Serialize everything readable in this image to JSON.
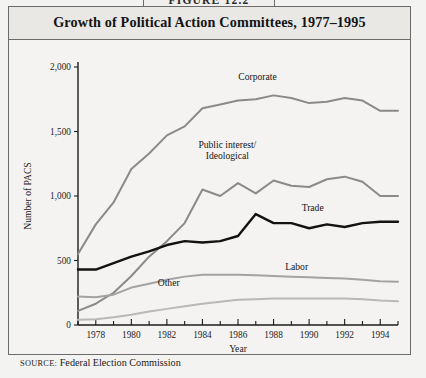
{
  "figure": {
    "number_label": "FIGURE 12.2",
    "title": "Growth of Political Action Committees, 1977–1995",
    "source_prefix": "SOURCE:",
    "source_text": " Federal Election Commission"
  },
  "chart_data": {
    "type": "line",
    "title": "Growth of Political Action Committees, 1977–1995",
    "xlabel": "Year",
    "ylabel": "Number of PACS",
    "xlim": [
      1977,
      1995
    ],
    "ylim": [
      0,
      2000
    ],
    "grid": false,
    "legend_position": "inline-labels",
    "x_tick_labels": [
      "1978",
      "1980",
      "1982",
      "1984",
      "1986",
      "1988",
      "1990",
      "1992",
      "1994"
    ],
    "x_tick_values": [
      1978,
      1980,
      1982,
      1984,
      1986,
      1988,
      1990,
      1992,
      1994
    ],
    "x_minor_ticks": [
      1977,
      1979,
      1981,
      1983,
      1985,
      1987,
      1989,
      1991,
      1993,
      1995
    ],
    "y_tick_labels": [
      "0",
      "500",
      "1,000",
      "1,500",
      "2,000"
    ],
    "y_tick_values": [
      0,
      500,
      1000,
      1500,
      2000
    ],
    "x": [
      1977,
      1978,
      1979,
      1980,
      1981,
      1982,
      1983,
      1984,
      1985,
      1986,
      1987,
      1988,
      1989,
      1990,
      1991,
      1992,
      1993,
      1994,
      1995
    ],
    "series": [
      {
        "name": "Corporate",
        "color": "#8a8a8a",
        "width": 2.0,
        "label_x": 1987.1,
        "label_y": 1900,
        "values": [
          550,
          780,
          950,
          1210,
          1330,
          1470,
          1540,
          1680,
          1710,
          1740,
          1750,
          1780,
          1760,
          1720,
          1730,
          1760,
          1740,
          1660,
          1660
        ]
      },
      {
        "name": "Public interest/\nIdeological",
        "name_lines": [
          "Public interest/",
          "Ideological"
        ],
        "color": "#8a8a8a",
        "width": 2.0,
        "label_x": 1985.4,
        "label_y": 1370,
        "values": [
          110,
          165,
          250,
          380,
          530,
          650,
          790,
          1050,
          1000,
          1100,
          1020,
          1120,
          1080,
          1070,
          1130,
          1150,
          1110,
          1000,
          1000
        ]
      },
      {
        "name": "Trade",
        "color": "#121212",
        "width": 2.4,
        "label_x": 1990.2,
        "label_y": 880,
        "values": [
          430,
          430,
          480,
          530,
          570,
          620,
          650,
          640,
          650,
          690,
          860,
          790,
          790,
          750,
          780,
          760,
          790,
          800,
          800
        ]
      },
      {
        "name": "Labor",
        "color": "#a3a3a3",
        "width": 2.0,
        "label_x": 1989.3,
        "label_y": 430,
        "values": [
          220,
          215,
          235,
          290,
          320,
          350,
          375,
          390,
          390,
          390,
          385,
          380,
          375,
          370,
          365,
          360,
          350,
          340,
          335
        ]
      },
      {
        "name": "Other",
        "color": "#b8b8b8",
        "width": 2.0,
        "label_x": 1982.1,
        "label_y": 300,
        "values": [
          40,
          45,
          60,
          80,
          105,
          125,
          145,
          165,
          180,
          195,
          200,
          205,
          205,
          205,
          205,
          205,
          200,
          190,
          185
        ]
      }
    ]
  }
}
